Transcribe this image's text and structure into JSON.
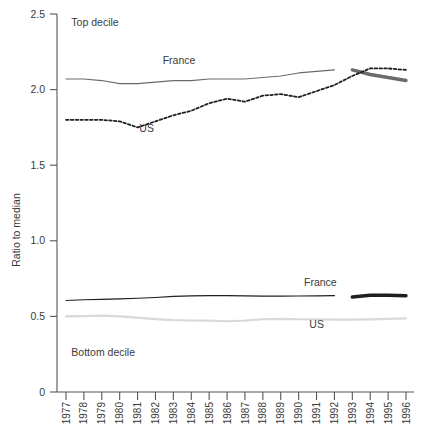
{
  "chart_data": {
    "type": "line",
    "title": "",
    "xlabel": "",
    "ylabel": "Ratio to median",
    "ylim": [
      0,
      2.5
    ],
    "yticks": [
      "0",
      "0.5",
      "1.0",
      "1.5",
      "2.0",
      "2.5"
    ],
    "ytick_values": [
      0,
      0.5,
      1.0,
      1.5,
      2.0,
      2.5
    ],
    "grid": false,
    "legend_position": "inline-annotations",
    "x": [
      1977,
      1978,
      1979,
      1980,
      1981,
      1982,
      1983,
      1984,
      1985,
      1986,
      1987,
      1988,
      1989,
      1990,
      1991,
      1992,
      1993,
      1994,
      1995,
      1996
    ],
    "xtick_labels": [
      "1977",
      "1978",
      "1979",
      "1980",
      "1981",
      "1982",
      "1983",
      "1984",
      "1985",
      "1986",
      "1987",
      "1988",
      "1989",
      "1990",
      "1991",
      "1992",
      "1993",
      "1994",
      "1995",
      "1996"
    ],
    "annotations": [
      {
        "text": "Top decile",
        "x": 1977.3,
        "y": 2.42
      },
      {
        "text": "Bottom decile",
        "x": 1977.3,
        "y": 0.24
      },
      {
        "text": "France",
        "x": 1982.4,
        "y": 2.17
      },
      {
        "text": "US",
        "x": 1981.1,
        "y": 1.72
      },
      {
        "text": "France",
        "x": 1990.3,
        "y": 0.7
      },
      {
        "text": "US",
        "x": 1990.6,
        "y": 0.42
      }
    ],
    "series": [
      {
        "name": "France",
        "group": "Top decile",
        "style": "solid-thin",
        "color": "#6b6b6b",
        "x": [
          1977,
          1978,
          1979,
          1980,
          1981,
          1982,
          1983,
          1984,
          1985,
          1986,
          1987,
          1988,
          1989,
          1990,
          1991,
          1992
        ],
        "values": [
          2.07,
          2.07,
          2.06,
          2.04,
          2.04,
          2.05,
          2.06,
          2.06,
          2.07,
          2.07,
          2.07,
          2.08,
          2.09,
          2.11,
          2.12,
          2.13
        ]
      },
      {
        "name": "France",
        "group": "Top decile",
        "style": "solid-thick",
        "color": "#6b6b6b",
        "x": [
          1993,
          1994,
          1995,
          1996
        ],
        "values": [
          2.13,
          2.1,
          2.08,
          2.06
        ]
      },
      {
        "name": "US",
        "group": "Top decile",
        "style": "dotted",
        "color": "#1f1f1f",
        "x": [
          1977,
          1978,
          1979,
          1980,
          1981,
          1982,
          1983,
          1984,
          1985,
          1986,
          1987,
          1988,
          1989,
          1990,
          1991,
          1992,
          1993,
          1994,
          1995,
          1996
        ],
        "values": [
          1.8,
          1.8,
          1.8,
          1.79,
          1.75,
          1.79,
          1.83,
          1.86,
          1.91,
          1.94,
          1.92,
          1.96,
          1.97,
          1.95,
          1.99,
          2.03,
          2.09,
          2.14,
          2.14,
          2.13
        ]
      },
      {
        "name": "France",
        "group": "Bottom decile",
        "style": "solid-thin",
        "color": "#1f1f1f",
        "x": [
          1977,
          1978,
          1979,
          1980,
          1981,
          1982,
          1983,
          1984,
          1985,
          1986,
          1987,
          1988,
          1989,
          1990,
          1991,
          1992
        ],
        "values": [
          0.605,
          0.61,
          0.613,
          0.616,
          0.62,
          0.625,
          0.632,
          0.636,
          0.637,
          0.637,
          0.636,
          0.634,
          0.634,
          0.635,
          0.636,
          0.637
        ]
      },
      {
        "name": "France",
        "group": "Bottom decile",
        "style": "solid-thick",
        "color": "#1f1f1f",
        "x": [
          1993,
          1994,
          1995,
          1996
        ],
        "values": [
          0.628,
          0.64,
          0.64,
          0.637
        ]
      },
      {
        "name": "US",
        "group": "Bottom decile",
        "style": "solid-light",
        "color": "#d9d9d9",
        "x": [
          1977,
          1978,
          1979,
          1980,
          1981,
          1982,
          1983,
          1984,
          1985,
          1986,
          1987,
          1988,
          1989,
          1990,
          1991,
          1992,
          1993,
          1994,
          1995,
          1996
        ],
        "values": [
          0.5,
          0.502,
          0.505,
          0.5,
          0.492,
          0.482,
          0.475,
          0.473,
          0.472,
          0.468,
          0.472,
          0.481,
          0.483,
          0.481,
          0.48,
          0.479,
          0.479,
          0.48,
          0.483,
          0.487
        ]
      }
    ]
  }
}
